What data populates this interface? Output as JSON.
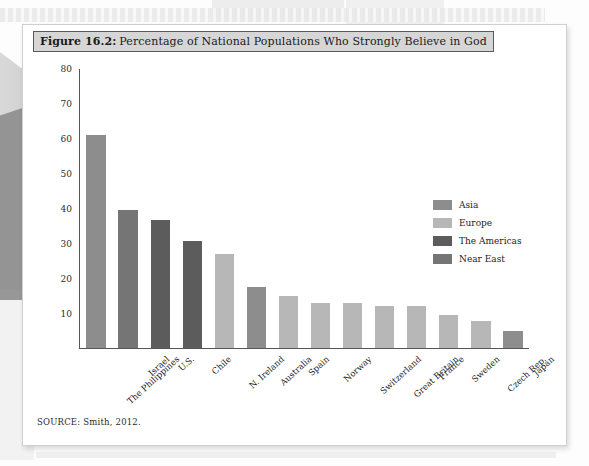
{
  "figure": {
    "number_label": "Figure 16.2:",
    "title": "Percentage of National Populations Who Strongly Believe in God",
    "source": "SOURCE: Smith, 2012."
  },
  "palette": {
    "asia": "#8d8d8d",
    "europe": "#b7b7b7",
    "americas": "#5c5c5c",
    "near_east": "#757575",
    "axis": "#555555",
    "title_band_bg": "#d6d6d6",
    "page_bg": "#ffffff"
  },
  "chart_data": {
    "type": "bar",
    "title": "Percentage of National Populations Who Strongly Believe in God",
    "xlabel": "",
    "ylabel": "",
    "ylim": [
      0,
      80
    ],
    "yticks": [
      10,
      20,
      30,
      40,
      50,
      60,
      70,
      80
    ],
    "grid": false,
    "legend_position": "right-middle",
    "legend": [
      {
        "name": "Asia",
        "color": "#8d8d8d"
      },
      {
        "name": "Europe",
        "color": "#b7b7b7"
      },
      {
        "name": "The Americas",
        "color": "#5c5c5c"
      },
      {
        "name": "Near East",
        "color": "#757575"
      }
    ],
    "categories": [
      "The Philippines",
      "Israel",
      "U.S.",
      "Chile",
      "N. Ireland",
      "Australia",
      "Spain",
      "Norway",
      "Switzerland",
      "Great Britain",
      "France",
      "Sweden",
      "Czech Rep.",
      "Japan"
    ],
    "values": [
      61,
      39.5,
      36.5,
      30.5,
      27,
      17.5,
      15,
      12.8,
      12.8,
      12,
      12,
      9.3,
      7.8,
      4.8
    ],
    "groups": [
      "Asia",
      "Near East",
      "The Americas",
      "The Americas",
      "Europe",
      "Asia",
      "Europe",
      "Europe",
      "Europe",
      "Europe",
      "Europe",
      "Europe",
      "Europe",
      "Asia"
    ]
  }
}
